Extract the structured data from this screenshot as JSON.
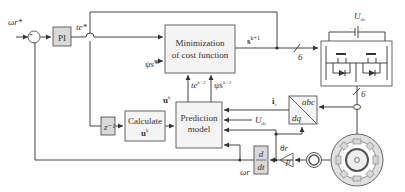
{
  "diagram": {
    "inputs": {
      "speed_ref": "ωr*",
      "flux_ref": "ψs*"
    },
    "blocks": {
      "pi": "PI",
      "cost_line1": "Minimization",
      "cost_line2": "of cost function",
      "delay": "z⁻¹",
      "calc_line1": "Calculate",
      "calc_line2": "u",
      "pred_line1": "Prediction",
      "pred_line2": "model",
      "transform_top": "abc",
      "transform_bottom": "dq",
      "deriv_top": "d",
      "deriv_bottom": "dt",
      "gain": "p"
    },
    "signals": {
      "torque_ref": "te*",
      "switch_state": "s",
      "switch_state_sup": "k+1",
      "bus_width_top": "6",
      "bus_width_right": "6",
      "torque_pred": "te",
      "torque_pred_sup": "k+2",
      "flux_pred": "ψs",
      "flux_pred_sup": "k+2",
      "voltage_vec": "u",
      "voltage_vec_sup": "k",
      "voltage_vec_sub": "s",
      "calc_sup": "k",
      "calc_sub": "s",
      "current": "i",
      "current_sub": "s",
      "dc_voltage_in": "U",
      "dc_voltage_in_sub": "dc",
      "dc_voltage": "U",
      "dc_voltage_sub": "dc",
      "rotor_speed": "ωr",
      "rotor_angle": "θr"
    },
    "summing_junction": {
      "plus": "+",
      "minus": "−"
    },
    "battery": {
      "minus": "-",
      "plus": "+"
    }
  }
}
